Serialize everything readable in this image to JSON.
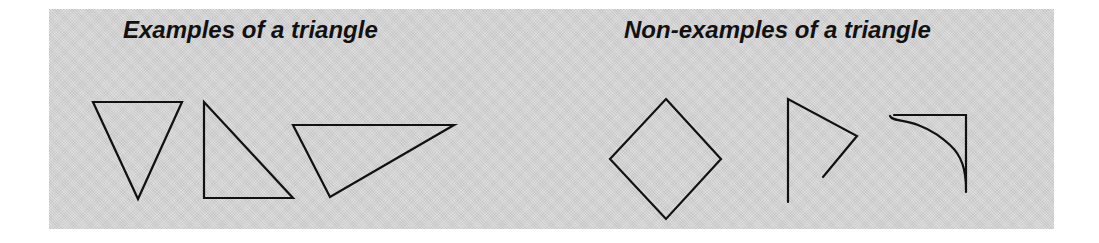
{
  "figure": {
    "background_color": "#d6d6d6",
    "stroke_color": "#111111",
    "sections": [
      {
        "title": "Examples of a triangle",
        "shapes": [
          {
            "name": "inverted-triangle",
            "kind": "triangle"
          },
          {
            "name": "right-triangle",
            "kind": "triangle"
          },
          {
            "name": "obtuse-triangle",
            "kind": "triangle"
          }
        ]
      },
      {
        "title": "Non-examples of a triangle",
        "shapes": [
          {
            "name": "diamond-square",
            "kind": "quadrilateral"
          },
          {
            "name": "open-figure",
            "kind": "open polyline"
          },
          {
            "name": "curved-side-figure",
            "kind": "figure with curved side"
          }
        ]
      }
    ]
  }
}
